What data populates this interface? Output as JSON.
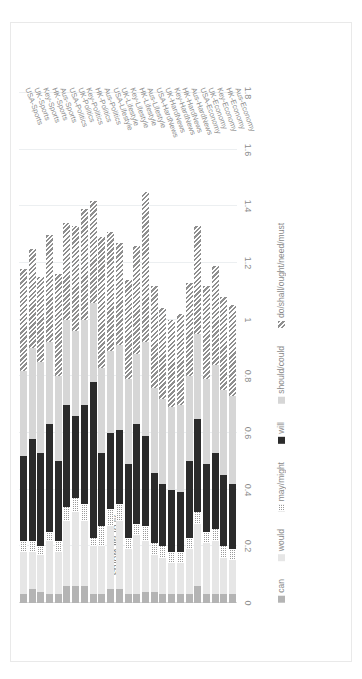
{
  "chart_data": {
    "type": "bar",
    "orientation": "horizontal-stacked",
    "title": "",
    "xlabel": "",
    "ylabel": "% of all words",
    "ylim": [
      0,
      1.8
    ],
    "tick_labels": [
      "0",
      "0.2",
      "0.4",
      "0.6",
      "0.8",
      "1",
      "1.2",
      "1.4",
      "1.6",
      "1.8"
    ],
    "tick_values": [
      0,
      0.2,
      0.4,
      0.6,
      0.8,
      1,
      1.2,
      1.4,
      1.6,
      1.8
    ],
    "grid": true,
    "legend_position": "bottom",
    "categories": [
      "Aus-Economy",
      "HK-Economy",
      "Key-Economy",
      "UK-Economy",
      "USA-Economy",
      "Aus-HardNews",
      "HK-HardNews",
      "Key-HardNews",
      "UK-HardNews",
      "USA-HardNews",
      "Aus-Lifestyle",
      "HK-Lifestyle",
      "Key-Lifestyle",
      "UK-Lifestyle",
      "USA-Lifestyle",
      "Aus-Politics",
      "HK-Politics",
      "Key-Politics",
      "UK-Politics",
      "USA-Politics",
      "Aus-Sports",
      "HK-Sports",
      "Key-Sports",
      "UK-Sports",
      "USA-Sports"
    ],
    "series": [
      {
        "name": "can",
        "color": "#b4b4b4",
        "values": [
          0.03,
          0.03,
          0.03,
          0.03,
          0.06,
          0.03,
          0.03,
          0.03,
          0.03,
          0.04,
          0.04,
          0.03,
          0.03,
          0.05,
          0.05,
          0.03,
          0.03,
          0.06,
          0.06,
          0.06,
          0.03,
          0.03,
          0.04,
          0.05,
          0.03
        ]
      },
      {
        "name": "would",
        "color": "#e6e6e6",
        "values": [
          0.12,
          0.13,
          0.19,
          0.18,
          0.22,
          0.16,
          0.11,
          0.11,
          0.13,
          0.13,
          0.18,
          0.21,
          0.16,
          0.24,
          0.22,
          0.17,
          0.17,
          0.23,
          0.26,
          0.23,
          0.15,
          0.19,
          0.13,
          0.13,
          0.15
        ]
      },
      {
        "name": "may/might",
        "color": "#9a9a9a",
        "values": [
          0.04,
          0.04,
          0.04,
          0.04,
          0.04,
          0.04,
          0.04,
          0.04,
          0.04,
          0.04,
          0.05,
          0.04,
          0.04,
          0.06,
          0.06,
          0.07,
          0.03,
          0.06,
          0.05,
          0.05,
          0.04,
          0.03,
          0.03,
          0.04,
          0.04
        ]
      },
      {
        "name": "will",
        "color": "#2b2b2b",
        "values": [
          0.23,
          0.25,
          0.27,
          0.24,
          0.33,
          0.27,
          0.21,
          0.22,
          0.22,
          0.25,
          0.32,
          0.35,
          0.26,
          0.26,
          0.27,
          0.26,
          0.55,
          0.35,
          0.29,
          0.36,
          0.28,
          0.38,
          0.33,
          0.36,
          0.3
        ]
      },
      {
        "name": "should/could",
        "color": "#d6d6d6",
        "values": [
          0.31,
          0.3,
          0.31,
          0.3,
          0.3,
          0.3,
          0.31,
          0.29,
          0.3,
          0.3,
          0.33,
          0.25,
          0.3,
          0.3,
          0.29,
          0.3,
          0.28,
          0.3,
          0.3,
          0.3,
          0.3,
          0.29,
          0.32,
          0.32,
          0.3
        ]
      },
      {
        "name": "do/shall/ought/need/must",
        "color": "#8f8f8f",
        "values": [
          0.32,
          0.33,
          0.35,
          0.33,
          0.38,
          0.33,
          0.32,
          0.31,
          0.32,
          0.36,
          0.53,
          0.38,
          0.35,
          0.36,
          0.42,
          0.46,
          0.36,
          0.39,
          0.37,
          0.34,
          0.36,
          0.38,
          0.3,
          0.35,
          0.36
        ]
      }
    ]
  },
  "legend": {
    "items": [
      {
        "label": "can",
        "color": "#b4b4b4",
        "pattern": "solid"
      },
      {
        "label": "would",
        "color": "#e6e6e6",
        "pattern": "solid"
      },
      {
        "label": "may/might",
        "color": "#9a9a9a",
        "pattern": "checker"
      },
      {
        "label": "will",
        "color": "#2b2b2b",
        "pattern": "solid"
      },
      {
        "label": "should/could",
        "color": "#d6d6d6",
        "pattern": "solid"
      },
      {
        "label": "do/shall/ought/need/must",
        "color": "#8f8f8f",
        "pattern": "hatch"
      }
    ]
  }
}
